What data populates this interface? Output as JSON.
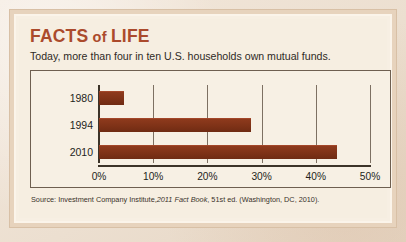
{
  "card": {
    "title_main": "FACTS",
    "title_of": "of",
    "title_tail": "LIFE",
    "subtitle": "Today, more than four in ten U.S. households own mutual funds.",
    "source_prefix": "Source: Investment Company Institute,",
    "source_italic": "2011 Fact Book",
    "source_suffix": ", 51st ed. (Washington, DC, 2010)."
  },
  "colors": {
    "title": "#ab4a2c",
    "bar": "#8e3a1d",
    "axis": "#3c3328",
    "gridline": "#7d7062",
    "card_background": "#f6eee1",
    "frame": "#e7d3bd",
    "page_background": "#efe3d6"
  },
  "chart_data": {
    "type": "bar",
    "orientation": "horizontal",
    "title": "",
    "subtitle": "Today, more than four in ten U.S. households own mutual funds.",
    "xlabel": "",
    "ylabel": "",
    "categories": [
      "1980",
      "1994",
      "2010"
    ],
    "values": [
      4.6,
      28,
      44
    ],
    "value_unit": "percent",
    "series": [
      {
        "name": "U.S. households owning mutual funds",
        "values": [
          4.6,
          28,
          44
        ]
      }
    ],
    "xlim": [
      0,
      50
    ],
    "xticks": [
      0,
      10,
      20,
      30,
      40,
      50
    ],
    "xticklabels": [
      "0%",
      "10%",
      "20%",
      "30%",
      "40%",
      "50%"
    ],
    "grid": true,
    "grid_axis": "x",
    "legend": false,
    "legend_position": "none",
    "source": "Source: Investment Company Institute, 2011 Fact Book, 51st ed. (Washington, DC, 2010)."
  }
}
